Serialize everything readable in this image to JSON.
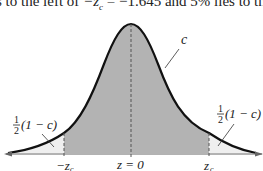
{
  "caption_fragment": {
    "prefix": "s to the left of ",
    "expr": "−z",
    "sub": "c",
    "mid": " = −1.645 and 5% lies to th"
  },
  "diagram": {
    "type": "normal-distribution-curve",
    "center_label": "z = 0",
    "left_critical_label": "−z",
    "right_critical_label": "z",
    "critical_subscript": "c",
    "center_area_label": "c",
    "tail_label_fraction_num": "1",
    "tail_label_fraction_den": "2",
    "tail_label_expr": "(1 − c)",
    "colors": {
      "center_fill": "#b3b3b3",
      "tail_fill": "#f0f0f0",
      "curve": "#111111",
      "axis": "#555555"
    }
  }
}
